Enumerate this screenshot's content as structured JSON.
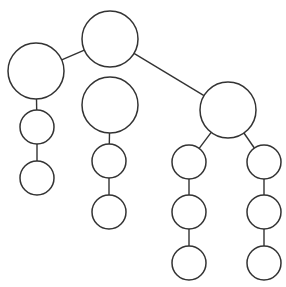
{
  "diagram": {
    "type": "tree",
    "canvas": {
      "width": 286,
      "height": 287
    },
    "colors": {
      "stroke": "#333333",
      "fill": "#ffffff",
      "background": "#ffffff"
    },
    "nodes": [
      {
        "id": "root",
        "cx": 110,
        "cy": 39,
        "r": 28
      },
      {
        "id": "left",
        "cx": 36,
        "cy": 71,
        "r": 28
      },
      {
        "id": "middle",
        "cx": 110,
        "cy": 105,
        "r": 28
      },
      {
        "id": "right",
        "cx": 228,
        "cy": 110,
        "r": 28
      },
      {
        "id": "left-1",
        "cx": 37,
        "cy": 127,
        "r": 17
      },
      {
        "id": "left-2",
        "cx": 37,
        "cy": 178,
        "r": 17
      },
      {
        "id": "middle-1",
        "cx": 109,
        "cy": 161,
        "r": 17
      },
      {
        "id": "middle-2",
        "cx": 109,
        "cy": 212,
        "r": 17
      },
      {
        "id": "right-a-1",
        "cx": 189,
        "cy": 162,
        "r": 17
      },
      {
        "id": "right-a-2",
        "cx": 189,
        "cy": 212,
        "r": 17
      },
      {
        "id": "right-a-3",
        "cx": 189,
        "cy": 263,
        "r": 17
      },
      {
        "id": "right-b-1",
        "cx": 264,
        "cy": 162,
        "r": 17
      },
      {
        "id": "right-b-2",
        "cx": 264,
        "cy": 212,
        "r": 17
      },
      {
        "id": "right-b-3",
        "cx": 264,
        "cy": 263,
        "r": 17
      }
    ],
    "edges": [
      {
        "from": "root",
        "to": "left"
      },
      {
        "from": "root",
        "to": "right"
      },
      {
        "from": "left",
        "to": "left-1"
      },
      {
        "from": "left-1",
        "to": "left-2"
      },
      {
        "from": "middle",
        "to": "middle-1"
      },
      {
        "from": "middle-1",
        "to": "middle-2"
      },
      {
        "from": "right",
        "to": "right-a-1"
      },
      {
        "from": "right-a-1",
        "to": "right-a-2"
      },
      {
        "from": "right-a-2",
        "to": "right-a-3"
      },
      {
        "from": "right",
        "to": "right-b-1"
      },
      {
        "from": "right-b-1",
        "to": "right-b-2"
      },
      {
        "from": "right-b-2",
        "to": "right-b-3"
      }
    ]
  }
}
